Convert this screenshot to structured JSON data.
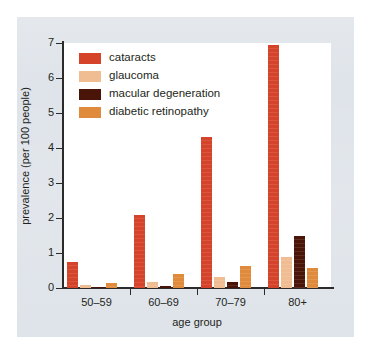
{
  "figure": {
    "background_color": "#dfe4ea",
    "plot_background_color": "#ffffff",
    "axis_color": "#2b2b2b"
  },
  "legend": {
    "position": "top-left-inside",
    "entries": [
      {
        "label": "cataracts",
        "color": "#d4432a"
      },
      {
        "label": "glaucoma",
        "color": "#f0bc92"
      },
      {
        "label": "macular degeneration",
        "color": "#4a1508"
      },
      {
        "label": "diabetic retinopathy",
        "color": "#e08b3c"
      }
    ]
  },
  "chart_data": {
    "type": "bar",
    "title": "",
    "subtitle": "",
    "xlabel": "age group",
    "ylabel": "prevalence (per 100 people)",
    "categories": [
      "50–59",
      "60–69",
      "70–79",
      "80+"
    ],
    "ylim": [
      0,
      7
    ],
    "yticks": [
      0,
      1,
      2,
      3,
      4,
      5,
      6,
      7
    ],
    "ytick_labels": [
      "0",
      "1",
      "2",
      "3",
      "4",
      "5",
      "6",
      "7"
    ],
    "grid": false,
    "legend_position": "upper left",
    "series": [
      {
        "name": "cataracts",
        "color": "#d4432a",
        "values": [
          0.73,
          2.08,
          4.32,
          6.95
        ]
      },
      {
        "name": "glaucoma",
        "color": "#f0bc92",
        "values": [
          0.08,
          0.18,
          0.32,
          0.88
        ]
      },
      {
        "name": "macular degeneration",
        "color": "#4a1508",
        "values": [
          0.02,
          0.05,
          0.16,
          1.48
        ]
      },
      {
        "name": "diabetic retinopathy",
        "color": "#e08b3c",
        "values": [
          0.13,
          0.4,
          0.64,
          0.57
        ]
      }
    ]
  }
}
